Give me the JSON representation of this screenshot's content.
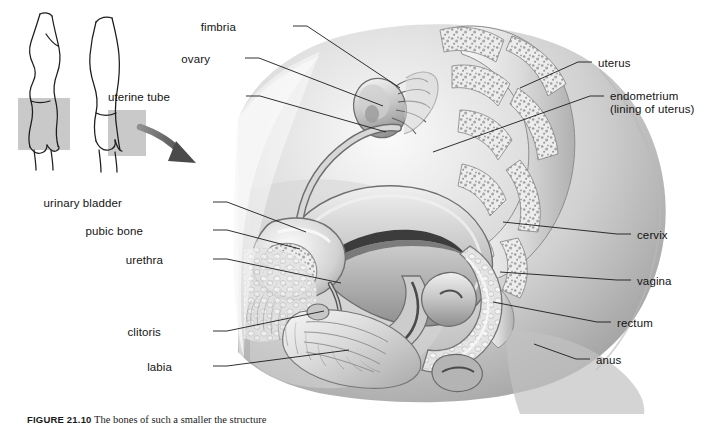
{
  "figure": {
    "caption_tag": "FIGURE 21.10",
    "caption_text": "The bones of such a smaller the structure"
  },
  "inset": {
    "name": "body-position-insets",
    "figure_left_label": "standing-body-outline-left",
    "figure_right_label": "standing-body-outline-right",
    "highlight_color": "#c9c9c9"
  },
  "arrow": {
    "name": "pointer-arrow",
    "color": "#6e6e6e"
  },
  "labels_left": [
    {
      "id": "fimbria",
      "text": "fimbria",
      "x": 236,
      "y": 21,
      "tx": 293,
      "ty": 26,
      "px": 400,
      "py": 88
    },
    {
      "id": "ovary",
      "text": "ovary",
      "x": 210,
      "y": 53,
      "tx": 245,
      "ty": 58,
      "px": 383,
      "py": 106
    },
    {
      "id": "uterine-tube",
      "text": "uterine tube",
      "x": 170,
      "y": 91,
      "tx": 246,
      "ty": 96,
      "px": 386,
      "py": 132
    },
    {
      "id": "urinary-bladder",
      "text": "urinary bladder",
      "x": 122,
      "y": 197,
      "tx": 213,
      "ty": 202,
      "px": 306,
      "py": 232
    },
    {
      "id": "pubic-bone",
      "text": "pubic bone",
      "x": 143,
      "y": 225,
      "tx": 213,
      "ty": 230,
      "px": 300,
      "py": 249
    },
    {
      "id": "urethra",
      "text": "urethra",
      "x": 163,
      "y": 254,
      "tx": 213,
      "ty": 259,
      "px": 341,
      "py": 283
    },
    {
      "id": "clitoris",
      "text": "clitoris",
      "x": 161,
      "y": 326,
      "tx": 213,
      "ty": 331,
      "px": 324,
      "py": 311
    },
    {
      "id": "labia",
      "text": "labia",
      "x": 172,
      "y": 361,
      "tx": 213,
      "ty": 366,
      "px": 349,
      "py": 350
    }
  ],
  "labels_right": [
    {
      "id": "uterus",
      "text": "uterus",
      "sub": "",
      "x": 598,
      "y": 57,
      "tx": 592,
      "ty": 62,
      "px": 520,
      "py": 88
    },
    {
      "id": "endometrium",
      "text": "endometrium",
      "sub": "(lining of uterus)",
      "x": 610,
      "y": 90,
      "tx": 604,
      "ty": 96,
      "px": 433,
      "py": 152
    },
    {
      "id": "cervix",
      "text": "cervix",
      "sub": "",
      "x": 637,
      "y": 229,
      "tx": 631,
      "ty": 234,
      "px": 503,
      "py": 222
    },
    {
      "id": "vagina",
      "text": "vagina",
      "sub": "",
      "x": 637,
      "y": 275,
      "tx": 631,
      "ty": 280,
      "px": 500,
      "py": 272
    },
    {
      "id": "rectum",
      "text": "rectum",
      "sub": "",
      "x": 617,
      "y": 317,
      "tx": 611,
      "ty": 322,
      "px": 493,
      "py": 302
    },
    {
      "id": "anus",
      "text": "anus",
      "sub": "",
      "x": 596,
      "y": 354,
      "tx": 590,
      "ty": 359,
      "px": 534,
      "py": 344
    }
  ],
  "colors": {
    "line": "#1b1b1b",
    "text": "#141414",
    "background": "#ffffff",
    "tissue_light": "#e8e8e8",
    "tissue_mid": "#bdbdbd",
    "tissue_dark": "#8d8d8d",
    "bone": "#f2f2f2"
  }
}
